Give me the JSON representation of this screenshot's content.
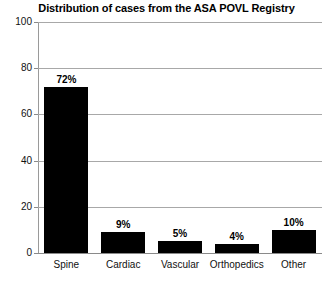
{
  "chart_data": {
    "type": "bar",
    "title": "Distribution of cases from the ASA POVL Registry",
    "xlabel": "",
    "ylabel": "",
    "ylim": [
      0,
      100
    ],
    "yticks": [
      0,
      20,
      40,
      60,
      80,
      100
    ],
    "ytick_labels": [
      "0",
      "20",
      "40",
      "60",
      "80",
      "100"
    ],
    "grid": true,
    "legend": false,
    "categories": [
      "Spine",
      "Cardiac",
      "Vascular",
      "Orthopedics",
      "Other"
    ],
    "values": [
      72,
      9,
      5,
      4,
      10
    ],
    "data_labels": [
      "72%",
      "9%",
      "5%",
      "4%",
      "10%"
    ],
    "bar_color": "#000000",
    "grid_color": "#a8a8a8",
    "background_color": "#ffffff"
  }
}
